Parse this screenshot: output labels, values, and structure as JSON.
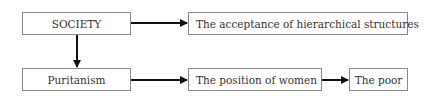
{
  "diagram": {
    "type": "flowchart",
    "nodes": [
      {
        "id": "society",
        "label": "SOCIETY"
      },
      {
        "id": "hierarchy",
        "label": "The acceptance of hierarchical structures"
      },
      {
        "id": "puritanism",
        "label": "Puritanism"
      },
      {
        "id": "women",
        "label": "The position of women"
      },
      {
        "id": "poor",
        "label": "The poor"
      }
    ],
    "edges": [
      {
        "from": "society",
        "to": "hierarchy"
      },
      {
        "from": "society",
        "to": "puritanism"
      },
      {
        "from": "puritanism",
        "to": "women"
      },
      {
        "from": "women",
        "to": "poor"
      }
    ],
    "colors": {
      "line": "#111111",
      "border": "#8a8a8a",
      "text": "#333333"
    }
  }
}
